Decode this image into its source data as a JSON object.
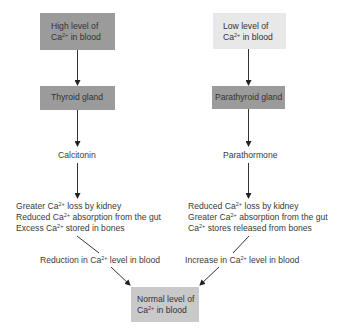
{
  "left": {
    "trigger": {
      "line1": "High level of",
      "ca": "Ca",
      "ion": "2+",
      "line2_rest": " in blood"
    },
    "gland": "Thyroid gland",
    "hormone": "Calcitonin",
    "effects": [
      {
        "pre": "Greater ",
        "ca": "Ca",
        "ion": "2+",
        "post": " loss by kidney"
      },
      {
        "pre": "Reduced ",
        "ca": "Ca",
        "ion": "2+",
        "post": " absorption from the gut"
      },
      {
        "pre": "Excess ",
        "ca": "Ca",
        "ion": "2+",
        "post": " stored in bones"
      }
    ],
    "result": {
      "pre": "Reduction in ",
      "ca": "Ca",
      "ion": "2+",
      "post": " level in blood"
    }
  },
  "right": {
    "trigger": {
      "line1": "Low level of",
      "ca": "Ca",
      "ion": "2+",
      "line2_rest": " in blood"
    },
    "gland": "Parathyroid gland",
    "hormone": "Parathormone",
    "effects": [
      {
        "pre": "Reduced ",
        "ca": "Ca",
        "ion": "2+",
        "post": " loss by kidney"
      },
      {
        "pre": "Greater ",
        "ca": "Ca",
        "ion": "2+",
        "post": " absorption from the gut"
      },
      {
        "pre": "",
        "ca": "Ca",
        "ion": "2+",
        "post": " stores released from bones"
      }
    ],
    "result": {
      "pre": "Increase in ",
      "ca": "Ca",
      "ion": "2+",
      "post": " level in blood"
    }
  },
  "outcome": {
    "line1": "Normal level of",
    "ca": "Ca",
    "ion": "2+",
    "line2_rest": " in blood"
  }
}
